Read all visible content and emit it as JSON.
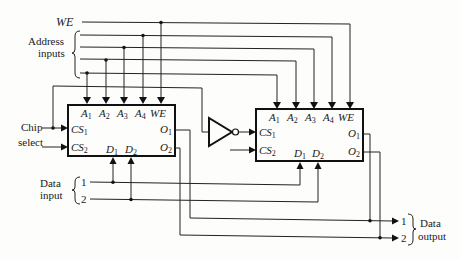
{
  "diagram": {
    "type": "memory-expansion-circuit",
    "labels": {
      "we": "WE",
      "address_inputs": [
        "Address",
        "inputs"
      ],
      "chip_select": [
        "Chip",
        "select"
      ],
      "data_input": [
        "Data",
        "input"
      ],
      "data_output": [
        "Data",
        "output"
      ],
      "data_in_1": "1",
      "data_in_2": "2",
      "data_out_1": "1",
      "data_out_2": "2"
    },
    "chips": [
      {
        "name": "memory-chip-left",
        "pins": {
          "a1": "A1",
          "a2": "A2",
          "a3": "A3",
          "a4": "A4",
          "we": "WE",
          "cs1": "CS1",
          "cs2": "CS2",
          "d1": "D1",
          "d2": "D2",
          "o1": "O1",
          "o2": "O2"
        }
      },
      {
        "name": "memory-chip-right",
        "pins": {
          "a1": "A1",
          "a2": "A2",
          "a3": "A3",
          "a4": "A4",
          "we": "WE",
          "cs1": "CS1",
          "cs2": "CS2",
          "d1": "D1",
          "d2": "D2",
          "o1": "O1",
          "o2": "O2"
        }
      }
    ],
    "components": [
      "inverter"
    ],
    "colors": {
      "ink": "#1a1a1a",
      "background": "#fdfdfb"
    }
  }
}
